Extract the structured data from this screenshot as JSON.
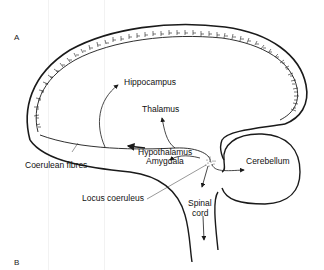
{
  "panels": {
    "a": "A",
    "b": "B"
  },
  "labels": {
    "hippocampus": "Hippocampus",
    "thalamus": "Thalamus",
    "hypothalamus": "Hypothalamus",
    "amygdala": "Amygdala",
    "coerulean_fibres": "Coerulean fibres",
    "locus_coeruleus": "Locus coeruleus",
    "cerebellum": "Cerebellum",
    "spinal": "Spinal",
    "cord": "cord"
  },
  "colors": {
    "ink": "#1a1a1a",
    "background": "#ffffff"
  }
}
